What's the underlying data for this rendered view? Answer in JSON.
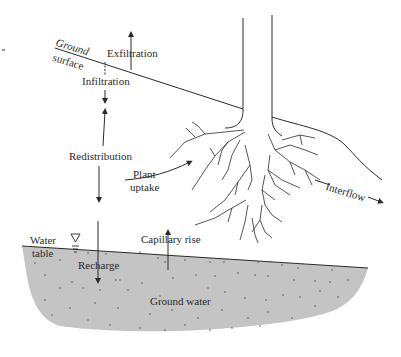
{
  "diagram": {
    "type": "hydrologic-soil-profile",
    "labels": {
      "ground_surface_line1": "Ground",
      "ground_surface_line2": "surface",
      "exfiltration": "Exfiltration",
      "infiltration": "Infiltration",
      "redistribution": "Redistribution",
      "plant_uptake_line1": "Plant",
      "plant_uptake_line2": "uptake",
      "interflow": "Interflow",
      "water_table_line1": "Water",
      "water_table_line2": "table",
      "capillary_rise": "Capillary rise",
      "recharge": "Recharge",
      "ground_water": "Ground water"
    },
    "icons": {
      "water_table_symbol": "inverted-triangle-water-level"
    },
    "colors": {
      "line": "#2a2a2a",
      "groundwater_fill": "#c4c4c4",
      "groundwater_dots": "#555555",
      "background": "#ffffff"
    }
  }
}
